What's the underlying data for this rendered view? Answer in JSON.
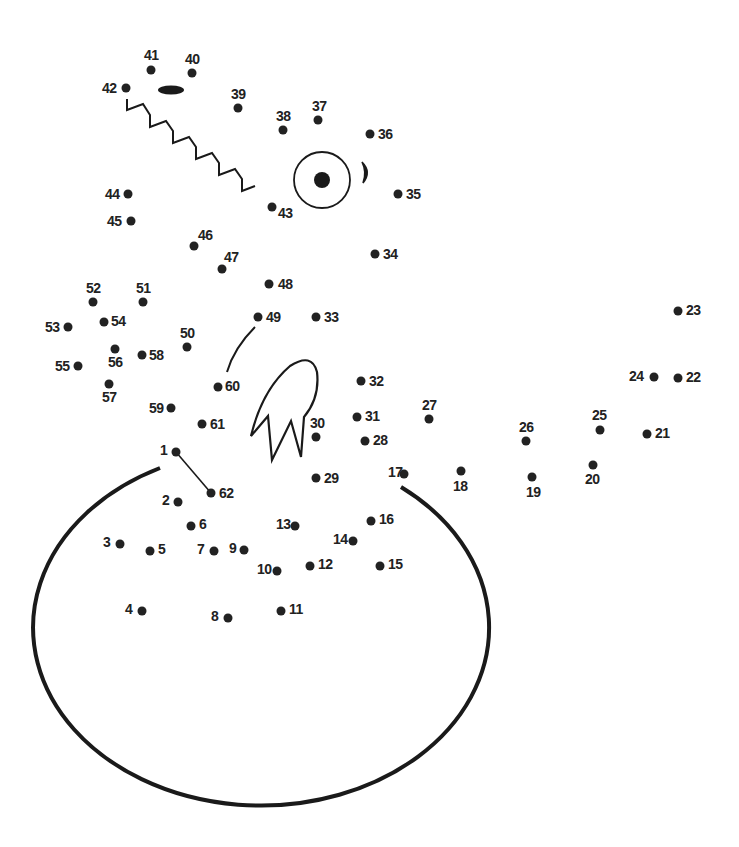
{
  "puzzle": {
    "type": "connect-the-dots",
    "subject": "dragon hatching from egg",
    "ink_color": "#222222",
    "background": "#ffffff",
    "dots": [
      {
        "n": "1",
        "x": 176,
        "y": 452,
        "lx": 160,
        "ly": 455
      },
      {
        "n": "2",
        "x": 178,
        "y": 502,
        "lx": 162,
        "ly": 505
      },
      {
        "n": "3",
        "x": 120,
        "y": 544,
        "lx": 103,
        "ly": 547
      },
      {
        "n": "4",
        "x": 142,
        "y": 611,
        "lx": 125,
        "ly": 614
      },
      {
        "n": "5",
        "x": 150,
        "y": 551,
        "lx": 158,
        "ly": 554
      },
      {
        "n": "6",
        "x": 191,
        "y": 526,
        "lx": 199,
        "ly": 529
      },
      {
        "n": "7",
        "x": 214,
        "y": 551,
        "lx": 197,
        "ly": 554
      },
      {
        "n": "8",
        "x": 228,
        "y": 618,
        "lx": 211,
        "ly": 621
      },
      {
        "n": "9",
        "x": 244,
        "y": 550,
        "lx": 229,
        "ly": 553
      },
      {
        "n": "10",
        "x": 277,
        "y": 571,
        "lx": 257,
        "ly": 574
      },
      {
        "n": "11",
        "x": 281,
        "y": 611,
        "lx": 289,
        "ly": 614
      },
      {
        "n": "12",
        "x": 310,
        "y": 566,
        "lx": 318,
        "ly": 569
      },
      {
        "n": "13",
        "x": 295,
        "y": 526,
        "lx": 276,
        "ly": 529
      },
      {
        "n": "14",
        "x": 353,
        "y": 541,
        "lx": 333,
        "ly": 544
      },
      {
        "n": "15",
        "x": 380,
        "y": 566,
        "lx": 388,
        "ly": 569
      },
      {
        "n": "16",
        "x": 371,
        "y": 521,
        "lx": 379,
        "ly": 524
      },
      {
        "n": "17",
        "x": 404,
        "y": 474,
        "lx": 388,
        "ly": 477
      },
      {
        "n": "18",
        "x": 461,
        "y": 471,
        "lx": 453,
        "ly": 491
      },
      {
        "n": "19",
        "x": 532,
        "y": 477,
        "lx": 526,
        "ly": 497
      },
      {
        "n": "20",
        "x": 593,
        "y": 465,
        "lx": 585,
        "ly": 484
      },
      {
        "n": "21",
        "x": 647,
        "y": 434,
        "lx": 655,
        "ly": 438
      },
      {
        "n": "22",
        "x": 678,
        "y": 378,
        "lx": 686,
        "ly": 382
      },
      {
        "n": "23",
        "x": 678,
        "y": 311,
        "lx": 686,
        "ly": 315
      },
      {
        "n": "24",
        "x": 654,
        "y": 377,
        "lx": 629,
        "ly": 381
      },
      {
        "n": "25",
        "x": 600,
        "y": 430,
        "lx": 592,
        "ly": 420
      },
      {
        "n": "26",
        "x": 526,
        "y": 441,
        "lx": 519,
        "ly": 432
      },
      {
        "n": "27",
        "x": 429,
        "y": 419,
        "lx": 422,
        "ly": 410
      },
      {
        "n": "28",
        "x": 365,
        "y": 441,
        "lx": 373,
        "ly": 445
      },
      {
        "n": "29",
        "x": 316,
        "y": 478,
        "lx": 324,
        "ly": 483
      },
      {
        "n": "30",
        "x": 316,
        "y": 437,
        "lx": 310,
        "ly": 428
      },
      {
        "n": "31",
        "x": 357,
        "y": 417,
        "lx": 365,
        "ly": 421
      },
      {
        "n": "32",
        "x": 361,
        "y": 381,
        "lx": 369,
        "ly": 386
      },
      {
        "n": "33",
        "x": 316,
        "y": 317,
        "lx": 324,
        "ly": 322
      },
      {
        "n": "34",
        "x": 375,
        "y": 254,
        "lx": 383,
        "ly": 259
      },
      {
        "n": "35",
        "x": 398,
        "y": 194,
        "lx": 406,
        "ly": 199
      },
      {
        "n": "36",
        "x": 370,
        "y": 134,
        "lx": 378,
        "ly": 139
      },
      {
        "n": "37",
        "x": 318,
        "y": 120,
        "lx": 312,
        "ly": 111
      },
      {
        "n": "38",
        "x": 283,
        "y": 130,
        "lx": 276,
        "ly": 121
      },
      {
        "n": "39",
        "x": 238,
        "y": 108,
        "lx": 231,
        "ly": 99
      },
      {
        "n": "40",
        "x": 192,
        "y": 73,
        "lx": 185,
        "ly": 64
      },
      {
        "n": "41",
        "x": 151,
        "y": 70,
        "lx": 144,
        "ly": 60
      },
      {
        "n": "42",
        "x": 126,
        "y": 88,
        "lx": 102,
        "ly": 93
      },
      {
        "n": "43",
        "x": 272,
        "y": 207,
        "lx": 278,
        "ly": 218
      },
      {
        "n": "44",
        "x": 128,
        "y": 194,
        "lx": 105,
        "ly": 199
      },
      {
        "n": "45",
        "x": 131,
        "y": 221,
        "lx": 107,
        "ly": 226
      },
      {
        "n": "46",
        "x": 194,
        "y": 246,
        "lx": 198,
        "ly": 240
      },
      {
        "n": "47",
        "x": 222,
        "y": 269,
        "lx": 224,
        "ly": 262
      },
      {
        "n": "48",
        "x": 269,
        "y": 284,
        "lx": 278,
        "ly": 289
      },
      {
        "n": "49",
        "x": 258,
        "y": 317,
        "lx": 266,
        "ly": 322
      },
      {
        "n": "50",
        "x": 187,
        "y": 347,
        "lx": 180,
        "ly": 338
      },
      {
        "n": "51",
        "x": 143,
        "y": 302,
        "lx": 136,
        "ly": 293
      },
      {
        "n": "52",
        "x": 93,
        "y": 302,
        "lx": 86,
        "ly": 293
      },
      {
        "n": "53",
        "x": 68,
        "y": 327,
        "lx": 45,
        "ly": 332
      },
      {
        "n": "54",
        "x": 104,
        "y": 322,
        "lx": 111,
        "ly": 326
      },
      {
        "n": "55",
        "x": 78,
        "y": 366,
        "lx": 55,
        "ly": 371
      },
      {
        "n": "56",
        "x": 115,
        "y": 349,
        "lx": 108,
        "ly": 367
      },
      {
        "n": "57",
        "x": 109,
        "y": 384,
        "lx": 102,
        "ly": 402
      },
      {
        "n": "58",
        "x": 142,
        "y": 355,
        "lx": 149,
        "ly": 360
      },
      {
        "n": "59",
        "x": 171,
        "y": 408,
        "lx": 149,
        "ly": 413
      },
      {
        "n": "60",
        "x": 218,
        "y": 387,
        "lx": 225,
        "ly": 391
      },
      {
        "n": "61",
        "x": 202,
        "y": 424,
        "lx": 210,
        "ly": 429
      },
      {
        "n": "62",
        "x": 211,
        "y": 493,
        "lx": 219,
        "ly": 498
      }
    ],
    "guide_line": {
      "from": "1",
      "to": "62"
    }
  }
}
